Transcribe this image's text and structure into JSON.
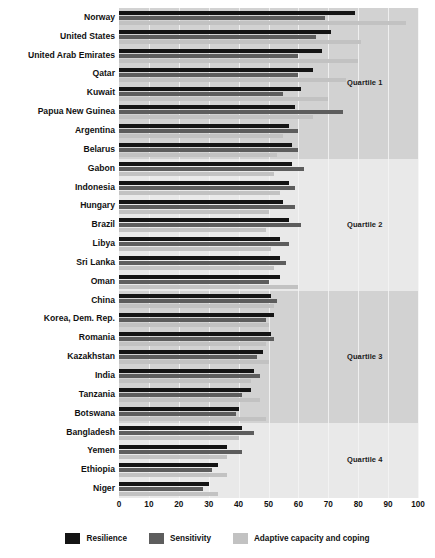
{
  "chart_data": {
    "type": "bar",
    "orientation": "horizontal",
    "title": "",
    "xlabel": "",
    "ylabel": "",
    "xlim": [
      0,
      100
    ],
    "xticks": [
      "0",
      "10",
      "20",
      "30",
      "40",
      "50",
      "60",
      "70",
      "80",
      "90",
      "100"
    ],
    "grid": true,
    "legend_position": "bottom",
    "categories": [
      "Norway",
      "United States",
      "United Arab Emirates",
      "Qatar",
      "Kuwait",
      "Papua New Guinea",
      "Argentina",
      "Belarus",
      "Gabon",
      "Indonesia",
      "Hungary",
      "Brazil",
      "Libya",
      "Sri Lanka",
      "Oman",
      "China",
      "Korea, Dem. Rep.",
      "Romania",
      "Kazakhstan",
      "India",
      "Tanzania",
      "Botswana",
      "Bangladesh",
      "Yemen",
      "Ethiopia",
      "Niger"
    ],
    "series": [
      {
        "name": "Resilience",
        "color": "#141414",
        "values": [
          79,
          71,
          68,
          65,
          61,
          59,
          57,
          58,
          58,
          57,
          55,
          57,
          54,
          54,
          54,
          51,
          52,
          51,
          48,
          45,
          44,
          40,
          41,
          36,
          33,
          30
        ]
      },
      {
        "name": "Sensitivity",
        "color": "#5d5d5d",
        "values": [
          69,
          66,
          60,
          60,
          55,
          75,
          60,
          60,
          62,
          59,
          59,
          61,
          57,
          56,
          50,
          53,
          49,
          52,
          46,
          47,
          41,
          39,
          45,
          41,
          31,
          28
        ]
      },
      {
        "name": "Adaptive capacity and coping",
        "color": "#c2c2c2",
        "values": [
          96,
          81,
          80,
          76,
          70,
          65,
          55,
          53,
          52,
          54,
          50,
          49,
          51,
          52,
          60,
          52,
          50,
          49,
          50,
          44,
          47,
          49,
          40,
          36,
          36,
          33
        ]
      }
    ],
    "bands": [
      {
        "label": "Quartile 1",
        "from_index": 0,
        "to_index": 7
      },
      {
        "label": "Quartile 2",
        "from_index": 8,
        "to_index": 14
      },
      {
        "label": "Quartile 3",
        "from_index": 15,
        "to_index": 21
      },
      {
        "label": "Quartile 4",
        "from_index": 22,
        "to_index": 25
      }
    ]
  },
  "legend": {
    "items": [
      {
        "label": "Resilience",
        "color": "#141414"
      },
      {
        "label": "Sensitivity",
        "color": "#5d5d5d"
      },
      {
        "label": "Adaptive capacity and coping",
        "color": "#c2c2c2"
      }
    ]
  },
  "quartiles": {
    "q1": "Quartile 1",
    "q2": "Quartile 2",
    "q3": "Quartile 3",
    "q4": "Quartile 4"
  }
}
